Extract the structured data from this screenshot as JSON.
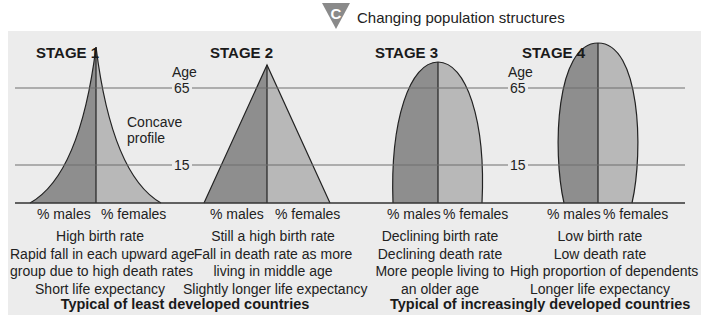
{
  "figure": {
    "badge_letter": "C",
    "title": "Changing population structures",
    "axis_label": "Age",
    "age_lines": [
      "65",
      "15"
    ],
    "colors": {
      "panel_bg": "#ececec",
      "males": "#8e8e8e",
      "females": "#b8b8b8",
      "badge": "#8a8a8a"
    },
    "stages": [
      {
        "label": "STAGE 1",
        "shape": "concave pyramid",
        "males_label": "% males",
        "females_label": "% females",
        "annotation": [
          "Concave",
          "profile"
        ],
        "description": [
          "High birth rate",
          "Rapid fall in each upward age",
          "group due to high death rates",
          "Short life expectancy"
        ]
      },
      {
        "label": "STAGE 2",
        "shape": "triangle pyramid",
        "males_label": "% males",
        "females_label": "% females",
        "description": [
          "Still a high birth rate",
          "Fall in death rate as more",
          "living in middle age",
          "Slightly longer life expectancy"
        ]
      },
      {
        "label": "STAGE 3",
        "shape": "bell",
        "males_label": "% males",
        "females_label": "% females",
        "description": [
          "Declining birth rate",
          "Declining death rate",
          "More people living to",
          "an older age"
        ]
      },
      {
        "label": "STAGE 4",
        "shape": "elongated ellipse",
        "males_label": "% males",
        "females_label": "% females",
        "description": [
          "Low birth rate",
          "Low death rate",
          "High proportion of dependents",
          "Longer life expectancy"
        ]
      }
    ],
    "groups": [
      {
        "label": "Typical of least developed countries"
      },
      {
        "label": "Typical of increasingly developed countries"
      }
    ]
  }
}
